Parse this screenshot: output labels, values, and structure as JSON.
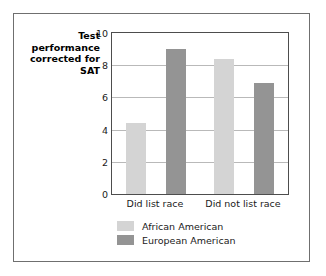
{
  "chart_data": {
    "type": "bar",
    "title": "",
    "xlabel": "",
    "ylabel": "Test performance corrected for SAT",
    "categories": [
      "Did list race",
      "Did not list race"
    ],
    "series": [
      {
        "name": "African American",
        "values": [
          4.4,
          8.4
        ],
        "color": "#d4d4d4"
      },
      {
        "name": "European American",
        "values": [
          9.0,
          6.9
        ],
        "color": "#949494"
      }
    ],
    "ylim": [
      0,
      10
    ],
    "yticks": [
      0,
      2,
      4,
      6,
      8,
      10
    ],
    "ytick_labels": [
      "0",
      "2",
      "4",
      "6",
      "8",
      "10"
    ],
    "grid": true,
    "legend_position": "bottom-left"
  },
  "axis": {
    "y_title": "Test performance corrected for SAT",
    "ticks": [
      "10",
      "8",
      "6",
      "4",
      "2",
      "0"
    ]
  },
  "categories": {
    "first": "Did list race",
    "second": "Did not list race"
  },
  "legend": {
    "items": [
      {
        "label": "African American"
      },
      {
        "label": "European American"
      }
    ]
  }
}
